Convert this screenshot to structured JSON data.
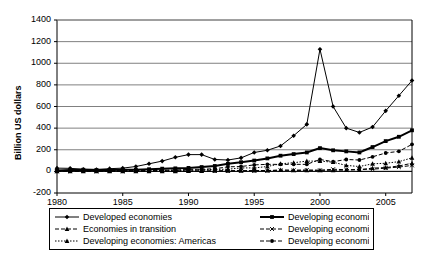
{
  "chart_data": {
    "type": "line",
    "title": "",
    "xlabel": "",
    "ylabel": "Billion US dollars",
    "xlim": [
      1980,
      2007
    ],
    "ylim": [
      -200,
      1400
    ],
    "ytick_values": [
      -200,
      0,
      200,
      400,
      600,
      800,
      1000,
      1200,
      1400
    ],
    "ytick_labels": [
      "-200",
      "0",
      "200",
      "400",
      "600",
      "800",
      "1000",
      "1200",
      "1400"
    ],
    "xtick_values": [
      1980,
      1985,
      1990,
      1995,
      2000,
      2005
    ],
    "xtick_labels": [
      "1980",
      "1985",
      "1990",
      "1995",
      "2000",
      "2005"
    ],
    "grid": "horizontal",
    "legend_position": "below",
    "x": [
      1980,
      1981,
      1982,
      1983,
      1984,
      1985,
      1986,
      1987,
      1988,
      1989,
      1990,
      1991,
      1992,
      1993,
      1994,
      1995,
      1996,
      1997,
      1998,
      1999,
      2000,
      2001,
      2002,
      2003,
      2004,
      2005,
      2006,
      2007
    ],
    "series": [
      {
        "name": "Developed economies",
        "line_style": "solid",
        "line_width": 1,
        "marker": "diamond",
        "color": "#000000",
        "values": [
          30,
          28,
          20,
          18,
          25,
          30,
          45,
          70,
          95,
          130,
          155,
          155,
          110,
          105,
          125,
          175,
          195,
          235,
          330,
          435,
          1130,
          600,
          400,
          360,
          410,
          560,
          700,
          840
        ]
      },
      {
        "name": "Developing economies",
        "line_style": "solid",
        "line_width": 2,
        "marker": "square",
        "color": "#000000",
        "values": [
          8,
          12,
          15,
          12,
          13,
          15,
          15,
          20,
          25,
          28,
          32,
          40,
          50,
          70,
          85,
          100,
          120,
          145,
          160,
          175,
          215,
          195,
          185,
          175,
          225,
          280,
          320,
          380
        ]
      },
      {
        "name": "Economies in transition",
        "line_style": "dashed",
        "line_width": 1,
        "marker": "triangle",
        "color": "#000000",
        "values": [
          0,
          0,
          0,
          0,
          0,
          0,
          0,
          0,
          0,
          0,
          2,
          3,
          4,
          6,
          6,
          7,
          8,
          12,
          10,
          10,
          10,
          10,
          12,
          15,
          30,
          35,
          50,
          75
        ]
      },
      {
        "name": "Developing economies: Africa",
        "line_style": "dashed",
        "line_width": 1,
        "marker": "x",
        "color": "#000000",
        "values": [
          1,
          2,
          2,
          2,
          2,
          2,
          2,
          3,
          3,
          4,
          3,
          4,
          4,
          5,
          6,
          6,
          6,
          11,
          10,
          12,
          10,
          20,
          15,
          18,
          20,
          30,
          40,
          55
        ]
      },
      {
        "name": "Developing economies: Americas",
        "line_style": "dotted",
        "line_width": 1,
        "marker": "triangle",
        "color": "#000000",
        "values": [
          7,
          8,
          8,
          6,
          5,
          7,
          5,
          7,
          10,
          9,
          10,
          15,
          18,
          20,
          32,
          32,
          45,
          70,
          80,
          95,
          95,
          85,
          55,
          45,
          70,
          75,
          90,
          125
        ]
      },
      {
        "name": "Developing economies: Asia",
        "line_style": "dashed",
        "line_width": 1,
        "marker": "circle",
        "color": "#000000",
        "values": [
          1,
          2,
          3,
          3,
          4,
          5,
          6,
          8,
          10,
          13,
          18,
          20,
          24,
          42,
          45,
          60,
          65,
          65,
          65,
          65,
          110,
          90,
          110,
          105,
          135,
          170,
          185,
          250
        ]
      }
    ]
  }
}
